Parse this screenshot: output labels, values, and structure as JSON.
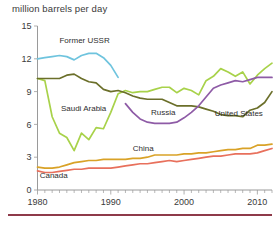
{
  "chart_data": {
    "type": "line",
    "title": "million barrels per day",
    "xlabel": "",
    "ylabel": "",
    "xlim": [
      1980,
      2012
    ],
    "ylim": [
      0,
      15
    ],
    "yticks": [
      0,
      3,
      6,
      9,
      12,
      15
    ],
    "ytick_labels": [
      "0",
      "3",
      "6",
      "9",
      "12",
      "15"
    ],
    "xticks": [
      1980,
      1990,
      2000,
      2010
    ],
    "xtick_labels": [
      "1980",
      "1990",
      "2000",
      "2010"
    ],
    "minor_xticks_every": 1,
    "grid": false,
    "legend": "inline-labels",
    "series": [
      {
        "name": "Former USSR",
        "color": "#6FC4DE",
        "label_x": 1983.0,
        "label_y": 13.4,
        "x": [
          1980,
          1981,
          1982,
          1983,
          1984,
          1985,
          1986,
          1987,
          1988,
          1989,
          1990,
          1991
        ],
        "values": [
          12.0,
          12.1,
          12.2,
          12.3,
          12.2,
          11.9,
          12.3,
          12.5,
          12.5,
          12.1,
          11.4,
          10.3
        ]
      },
      {
        "name": "Saudi Arabia",
        "color": "#A8D24A",
        "label_x": 1983.2,
        "label_y": 7.2,
        "x": [
          1980,
          1981,
          1982,
          1983,
          1984,
          1985,
          1986,
          1987,
          1988,
          1989,
          1990,
          1991,
          1992,
          1993,
          1994,
          1995,
          1996,
          1997,
          1998,
          1999,
          2000,
          2001,
          2002,
          2003,
          2004,
          2005,
          2006,
          2007,
          2008,
          2009,
          2010,
          2011,
          2012
        ],
        "values": [
          10.2,
          10.0,
          6.7,
          5.2,
          4.8,
          3.6,
          5.2,
          4.6,
          5.7,
          5.6,
          7.1,
          8.8,
          9.1,
          8.9,
          9.0,
          9.0,
          9.2,
          9.4,
          9.4,
          8.9,
          9.3,
          9.1,
          8.7,
          10.0,
          10.4,
          11.1,
          10.8,
          10.4,
          10.8,
          9.7,
          10.5,
          11.1,
          11.6
        ]
      },
      {
        "name": "United States",
        "color": "#6B6F2A",
        "label_x": 2004.2,
        "label_y": 6.8,
        "x": [
          1980,
          1981,
          1982,
          1983,
          1984,
          1985,
          1986,
          1987,
          1988,
          1989,
          1990,
          1991,
          1992,
          1993,
          1994,
          1995,
          1996,
          1997,
          1998,
          1999,
          2000,
          2001,
          2002,
          2003,
          2004,
          2005,
          2006,
          2007,
          2008,
          2009,
          2010,
          2011,
          2012
        ],
        "values": [
          10.2,
          10.2,
          10.2,
          10.2,
          10.5,
          10.6,
          10.2,
          9.9,
          9.8,
          9.2,
          9.0,
          9.1,
          8.9,
          8.6,
          8.4,
          8.3,
          8.3,
          8.3,
          8.0,
          7.7,
          7.7,
          7.7,
          7.6,
          7.4,
          7.2,
          6.9,
          6.8,
          6.8,
          6.7,
          7.3,
          7.5,
          8.0,
          9.0
        ]
      },
      {
        "name": "Russia",
        "color": "#8E5BA6",
        "label_x": 1995.5,
        "label_y": 6.9,
        "x": [
          1992,
          1993,
          1994,
          1995,
          1996,
          1997,
          1998,
          1999,
          2000,
          2001,
          2002,
          2003,
          2004,
          2005,
          2006,
          2007,
          2008,
          2009,
          2010,
          2011,
          2012
        ],
        "values": [
          7.9,
          7.1,
          6.5,
          6.2,
          6.1,
          6.1,
          6.1,
          6.2,
          6.6,
          7.1,
          7.7,
          8.5,
          9.3,
          9.6,
          9.8,
          10.0,
          9.9,
          10.1,
          10.3,
          10.3,
          10.3
        ]
      },
      {
        "name": "China",
        "color": "#D9A227",
        "label_x": 1993.0,
        "label_y": 3.6,
        "x": [
          1980,
          1981,
          1982,
          1983,
          1984,
          1985,
          1986,
          1987,
          1988,
          1989,
          1990,
          1991,
          1992,
          1993,
          1994,
          1995,
          1996,
          1997,
          1998,
          1999,
          2000,
          2001,
          2002,
          2003,
          2004,
          2005,
          2006,
          2007,
          2008,
          2009,
          2010,
          2011,
          2012
        ],
        "values": [
          2.1,
          2.0,
          2.0,
          2.1,
          2.3,
          2.5,
          2.6,
          2.7,
          2.7,
          2.8,
          2.8,
          2.8,
          2.8,
          2.9,
          2.9,
          3.0,
          3.2,
          3.2,
          3.2,
          3.2,
          3.3,
          3.3,
          3.4,
          3.4,
          3.5,
          3.6,
          3.7,
          3.7,
          3.8,
          3.8,
          4.1,
          4.1,
          4.2
        ]
      },
      {
        "name": "Canada",
        "color": "#E8705C",
        "label_x": 1980.3,
        "label_y": 1.1,
        "x": [
          1980,
          1981,
          1982,
          1983,
          1984,
          1985,
          1986,
          1987,
          1988,
          1989,
          1990,
          1991,
          1992,
          1993,
          1994,
          1995,
          1996,
          1997,
          1998,
          1999,
          2000,
          2001,
          2002,
          2003,
          2004,
          2005,
          2006,
          2007,
          2008,
          2009,
          2010,
          2011,
          2012
        ],
        "values": [
          1.75,
          1.6,
          1.6,
          1.7,
          1.8,
          1.9,
          1.9,
          2.0,
          2.0,
          2.0,
          2.0,
          2.1,
          2.2,
          2.3,
          2.4,
          2.4,
          2.5,
          2.6,
          2.7,
          2.6,
          2.7,
          2.8,
          2.9,
          3.0,
          3.1,
          3.1,
          3.2,
          3.3,
          3.3,
          3.3,
          3.4,
          3.6,
          3.8
        ]
      }
    ]
  }
}
